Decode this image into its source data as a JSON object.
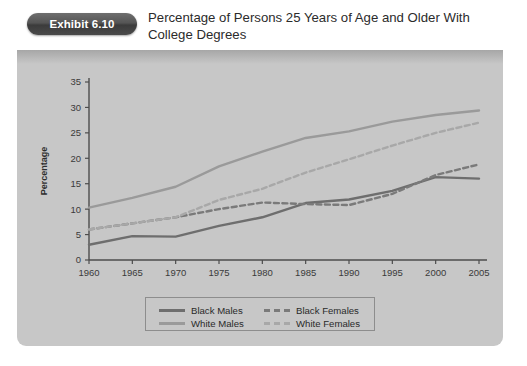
{
  "exhibit": {
    "badge_label": "Exhibit 6.10",
    "title": "Percentage of Persons 25 Years of Age and Older With College Degrees"
  },
  "colors": {
    "panel_bg": "#c7c7c7",
    "badge_dark": "#3b3b3b",
    "black_males": "#6e6e6e",
    "white_males": "#9a9a9a",
    "black_females": "#7a7a7a",
    "white_females": "#a8a8a8",
    "axis": "#4d4d4d"
  },
  "chart_data": {
    "type": "line",
    "title": "Percentage of Persons 25 Years of Age and Older With College Degrees",
    "xlabel": "",
    "ylabel": "Percentage",
    "x": [
      1960,
      1965,
      1970,
      1975,
      1980,
      1985,
      1990,
      1995,
      2000,
      2005
    ],
    "xlim": [
      1960,
      2005
    ],
    "ylim": [
      0,
      35
    ],
    "xticks": [
      "1960",
      "1965",
      "1970",
      "1975",
      "1980",
      "1985",
      "1990",
      "1995",
      "2000",
      "2005"
    ],
    "yticks": [
      "0",
      "5",
      "10",
      "15",
      "20",
      "25",
      "30",
      "35"
    ],
    "grid": false,
    "legend_position": "bottom-center",
    "series": [
      {
        "name": "Black Males",
        "style": "solid",
        "color": "#6e6e6e",
        "values": [
          3.0,
          4.7,
          4.6,
          6.7,
          8.4,
          11.2,
          11.9,
          13.6,
          16.3,
          16.0
        ]
      },
      {
        "name": "White Males",
        "style": "solid",
        "color": "#9a9a9a",
        "values": [
          10.3,
          12.2,
          14.4,
          18.4,
          21.3,
          24.0,
          25.3,
          27.2,
          28.5,
          29.4
        ]
      },
      {
        "name": "Black Females",
        "style": "dashed",
        "color": "#7a7a7a",
        "values": [
          6.0,
          7.2,
          8.4,
          10.0,
          11.3,
          11.0,
          10.8,
          13.0,
          16.7,
          18.8
        ]
      },
      {
        "name": "White Females",
        "style": "dashed",
        "color": "#a8a8a8",
        "values": [
          6.0,
          7.2,
          8.4,
          11.8,
          14.0,
          17.2,
          19.8,
          22.5,
          25.0,
          27.0
        ]
      }
    ]
  },
  "legend": {
    "entries": [
      {
        "label": "Black Males"
      },
      {
        "label": "Black Females"
      },
      {
        "label": "White Males"
      },
      {
        "label": "White Females"
      }
    ]
  }
}
